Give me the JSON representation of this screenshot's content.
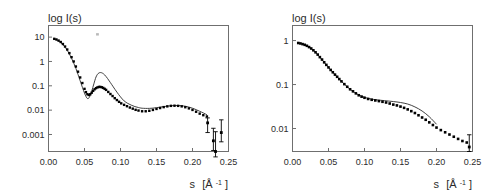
{
  "figure": {
    "background": "#ffffff",
    "panel_count": 2
  },
  "chart_data": [
    {
      "panel": "left",
      "type": "scatter",
      "title": "",
      "ylabel": "log I(s)",
      "xlabel": "s [Å-1]",
      "xlabel_parts": {
        "symbol": "s",
        "unit_open": "[Å",
        "exponent": "-1",
        "unit_close": "]"
      },
      "xlim": [
        0.0,
        0.25
      ],
      "ylim_log": [
        0.0002,
        30
      ],
      "yscale": "log",
      "grid": false,
      "legend": null,
      "xticks": [
        "0.00",
        "0.05",
        "0.10",
        "0.15",
        "0.20",
        "0.25"
      ],
      "xtick_values": [
        0.0,
        0.05,
        0.1,
        0.15,
        0.2,
        0.25
      ],
      "yticks": [
        "10",
        "1",
        "0.1",
        "0.01",
        "0.001"
      ],
      "ytick_values": [
        10,
        1,
        0.1,
        0.01,
        0.001
      ],
      "series": [
        {
          "name": "experimental data",
          "style": "filled-square-markers",
          "x": [
            0.008,
            0.011,
            0.014,
            0.017,
            0.02,
            0.023,
            0.026,
            0.029,
            0.032,
            0.035,
            0.038,
            0.041,
            0.044,
            0.047,
            0.05,
            0.052,
            0.054,
            0.056,
            0.058,
            0.06,
            0.062,
            0.064,
            0.066,
            0.068,
            0.07,
            0.072,
            0.074,
            0.076,
            0.078,
            0.08,
            0.083,
            0.086,
            0.089,
            0.092,
            0.095,
            0.098,
            0.101,
            0.105,
            0.109,
            0.113,
            0.117,
            0.121,
            0.125,
            0.13,
            0.135,
            0.14,
            0.145,
            0.15,
            0.155,
            0.16,
            0.165,
            0.17,
            0.175,
            0.18,
            0.185,
            0.19,
            0.195,
            0.2,
            0.205,
            0.21,
            0.215,
            0.22
          ],
          "y": [
            8.5,
            8.0,
            7.2,
            6.3,
            5.2,
            4.1,
            3.1,
            2.2,
            1.5,
            1.0,
            0.62,
            0.38,
            0.22,
            0.13,
            0.075,
            0.055,
            0.045,
            0.042,
            0.045,
            0.052,
            0.062,
            0.072,
            0.08,
            0.086,
            0.09,
            0.09,
            0.087,
            0.082,
            0.075,
            0.068,
            0.056,
            0.046,
            0.038,
            0.031,
            0.026,
            0.022,
            0.019,
            0.0165,
            0.0145,
            0.0128,
            0.0115,
            0.0103,
            0.0096,
            0.009,
            0.009,
            0.0094,
            0.0102,
            0.0112,
            0.0122,
            0.0133,
            0.0143,
            0.015,
            0.0152,
            0.015,
            0.0143,
            0.0132,
            0.0118,
            0.0102,
            0.0086,
            0.0072,
            0.0062,
            0.0055
          ]
        },
        {
          "name": "model fit",
          "style": "thin-line",
          "x": [
            0.008,
            0.014,
            0.02,
            0.026,
            0.032,
            0.038,
            0.044,
            0.05,
            0.054,
            0.057,
            0.06,
            0.063,
            0.066,
            0.069,
            0.072,
            0.075,
            0.078,
            0.082,
            0.086,
            0.09,
            0.095,
            0.1,
            0.105,
            0.11,
            0.115,
            0.12,
            0.125,
            0.13,
            0.14,
            0.15,
            0.16,
            0.17,
            0.18,
            0.19,
            0.2,
            0.21,
            0.22
          ],
          "y": [
            8.5,
            6.9,
            4.9,
            2.9,
            1.35,
            0.52,
            0.16,
            0.05,
            0.03,
            0.035,
            0.06,
            0.12,
            0.23,
            0.32,
            0.35,
            0.33,
            0.28,
            0.2,
            0.135,
            0.09,
            0.055,
            0.035,
            0.024,
            0.019,
            0.016,
            0.014,
            0.0128,
            0.012,
            0.0118,
            0.0126,
            0.014,
            0.0152,
            0.0155,
            0.0145,
            0.012,
            0.009,
            0.0065
          ]
        }
      ],
      "outlier_points": [
        {
          "x": 0.221,
          "y": 0.003,
          "yerr_low": 0.0012,
          "yerr_high": 0.0048
        },
        {
          "x": 0.229,
          "y": 0.00055,
          "yerr_low": 0.00022,
          "yerr_high": 0.0018
        },
        {
          "x": 0.232,
          "y": 0.0002,
          "yerr_low": 0.00012,
          "yerr_high": 0.0013
        },
        {
          "x": 0.24,
          "y": 0.0012,
          "yerr_low": 0.0005,
          "yerr_high": 0.004
        }
      ],
      "stray_marks": [
        {
          "x": 0.068,
          "y": 13.0
        }
      ]
    },
    {
      "panel": "right",
      "type": "scatter",
      "title": "",
      "ylabel": "log I(s)",
      "xlabel": "s [Å-1]",
      "xlabel_parts": {
        "symbol": "s",
        "unit_open": "[Å",
        "exponent": "-1",
        "unit_close": "]"
      },
      "xlim": [
        0.0,
        0.25
      ],
      "ylim_log": [
        0.003,
        2.2
      ],
      "yscale": "log",
      "grid": false,
      "legend": null,
      "xticks": [
        "0.00",
        "0.05",
        "0.10",
        "0.15",
        "0.20",
        "0.25"
      ],
      "xtick_values": [
        0.0,
        0.05,
        0.1,
        0.15,
        0.2,
        0.25
      ],
      "yticks": [
        "1",
        "0.1",
        "0.01"
      ],
      "ytick_values": [
        1,
        0.1,
        0.01
      ],
      "series": [
        {
          "name": "experimental data",
          "style": "filled-square-markers",
          "x": [
            0.008,
            0.011,
            0.014,
            0.017,
            0.02,
            0.023,
            0.026,
            0.029,
            0.032,
            0.035,
            0.038,
            0.041,
            0.044,
            0.047,
            0.05,
            0.053,
            0.056,
            0.059,
            0.062,
            0.065,
            0.068,
            0.072,
            0.076,
            0.08,
            0.084,
            0.088,
            0.092,
            0.096,
            0.1,
            0.105,
            0.11,
            0.115,
            0.12,
            0.125,
            0.13,
            0.135,
            0.14,
            0.145,
            0.15,
            0.155,
            0.16,
            0.165,
            0.17,
            0.175,
            0.18,
            0.185,
            0.19,
            0.195,
            0.2,
            0.206,
            0.212,
            0.218,
            0.224,
            0.23,
            0.236,
            0.242
          ],
          "y": [
            0.88,
            0.86,
            0.83,
            0.8,
            0.76,
            0.71,
            0.66,
            0.6,
            0.54,
            0.48,
            0.42,
            0.37,
            0.32,
            0.28,
            0.245,
            0.215,
            0.19,
            0.168,
            0.15,
            0.133,
            0.118,
            0.102,
            0.089,
            0.078,
            0.07,
            0.063,
            0.057,
            0.053,
            0.05,
            0.047,
            0.045,
            0.0435,
            0.042,
            0.0405,
            0.039,
            0.037,
            0.035,
            0.0335,
            0.0315,
            0.0295,
            0.0272,
            0.0248,
            0.0225,
            0.02,
            0.0178,
            0.0158,
            0.0138,
            0.012,
            0.0105,
            0.0092,
            0.0082,
            0.0073,
            0.0065,
            0.0058,
            0.0052,
            0.0048
          ]
        },
        {
          "name": "model fit",
          "style": "thin-line",
          "x": [
            0.008,
            0.02,
            0.032,
            0.044,
            0.056,
            0.068,
            0.08,
            0.092,
            0.104,
            0.116,
            0.128,
            0.14,
            0.15,
            0.16,
            0.17,
            0.18,
            0.19,
            0.2
          ],
          "y": [
            0.88,
            0.76,
            0.54,
            0.32,
            0.19,
            0.118,
            0.078,
            0.058,
            0.049,
            0.045,
            0.043,
            0.041,
            0.039,
            0.036,
            0.031,
            0.025,
            0.0185,
            0.0125
          ]
        }
      ],
      "outlier_points": [
        {
          "x": 0.2455,
          "y": 0.0038,
          "yerr_low": 0.003,
          "yerr_high": 0.0072
        }
      ],
      "stray_marks": []
    }
  ]
}
